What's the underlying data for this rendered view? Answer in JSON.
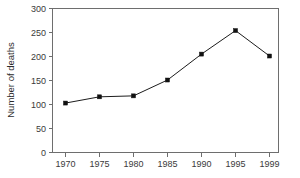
{
  "chart_data": {
    "type": "line",
    "title": "",
    "xlabel": "",
    "ylabel": "Number of deaths",
    "x": [
      1970,
      1975,
      1980,
      1985,
      1990,
      1995,
      1999
    ],
    "xtick_labels": [
      "1970",
      "1975",
      "1980",
      "1985",
      "1990",
      "1995",
      "1999"
    ],
    "values": [
      103,
      116,
      118,
      151,
      205,
      254,
      201
    ],
    "ytick_labels": [
      "0",
      "50",
      "100",
      "150",
      "200",
      "250",
      "300"
    ],
    "yticks": [
      0,
      50,
      100,
      150,
      200,
      250,
      300
    ],
    "ylim": [
      0,
      300
    ],
    "grid": false,
    "legend": null,
    "marker": "square",
    "line_color": "#1c1c1c",
    "marker_color": "#111111",
    "axis_color": "#6e6e6e",
    "background_color": "#ffffff"
  },
  "axes": {
    "y_title": "Number of deaths",
    "y_tick_0": "0",
    "y_tick_1": "50",
    "y_tick_2": "100",
    "y_tick_3": "150",
    "y_tick_4": "200",
    "y_tick_5": "250",
    "y_tick_6": "300",
    "x_tick_0": "1970",
    "x_tick_1": "1975",
    "x_tick_2": "1980",
    "x_tick_3": "1985",
    "x_tick_4": "1990",
    "x_tick_5": "1995",
    "x_tick_6": "1999"
  }
}
